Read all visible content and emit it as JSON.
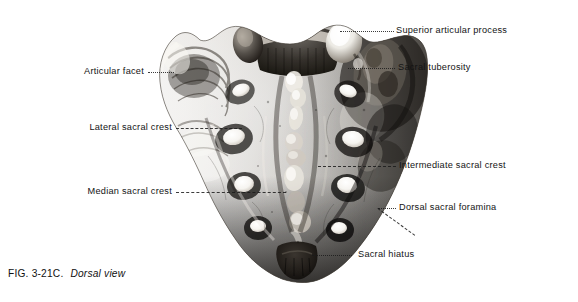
{
  "figure": {
    "caption_number": "FIG. 3-21C.",
    "caption_view": "Dorsal view",
    "illustration_name": "sacrum-dorsal-view",
    "colors": {
      "background": "#ffffff",
      "ink": "#141414",
      "leader": "#1b1b1b",
      "bone_light": "#f4f2ee",
      "bone_mid": "#9a938a",
      "bone_dark": "#2f2b27"
    }
  },
  "labels": [
    {
      "id": "superior-articular-process",
      "text": "Superior articular process",
      "side": "right"
    },
    {
      "id": "sacral-tuberosity",
      "text": "Sacral tuberosity",
      "side": "right"
    },
    {
      "id": "intermediate-sacral-crest",
      "text": "Intermediate sacral crest",
      "side": "right"
    },
    {
      "id": "dorsal-sacral-foramina",
      "text": "Dorsal sacral foramina",
      "side": "right"
    },
    {
      "id": "sacral-hiatus",
      "text": "Sacral hiatus",
      "side": "right"
    },
    {
      "id": "articular-facet",
      "text": "Articular facet",
      "side": "left"
    },
    {
      "id": "lateral-sacral-crest",
      "text": "Lateral sacral crest",
      "side": "left"
    },
    {
      "id": "median-sacral-crest",
      "text": "Median sacral crest",
      "side": "left"
    }
  ]
}
